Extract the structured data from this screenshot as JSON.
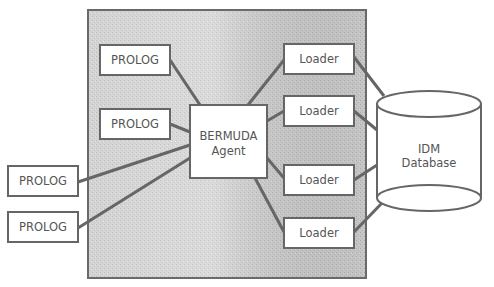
{
  "diagram": {
    "panel": {
      "fill": "#c8c8c8",
      "stroke": "#6a6a6a"
    },
    "line_color": "#666666",
    "text_color": "#555555",
    "agent": {
      "line1": "BERMUDA",
      "line2": "Agent"
    },
    "prolog_inside": [
      {
        "label": "PROLOG"
      },
      {
        "label": "PROLOG"
      }
    ],
    "prolog_outside": [
      {
        "label": "PROLOG"
      },
      {
        "label": "PROLOG"
      }
    ],
    "loaders": [
      {
        "label": "Loader"
      },
      {
        "label": "Loader"
      },
      {
        "label": "Loader"
      },
      {
        "label": "Loader"
      }
    ],
    "database": {
      "line1": "IDM",
      "line2": "Database"
    }
  }
}
